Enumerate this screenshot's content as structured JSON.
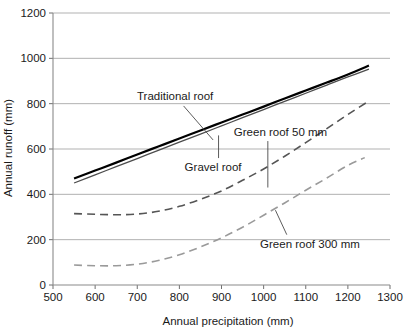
{
  "chart_data": {
    "type": "line",
    "title": "",
    "xlabel": "Annual precipitation (mm)",
    "ylabel": "Annual runoff (mm)",
    "xlim": [
      500,
      1300
    ],
    "ylim": [
      0,
      1200
    ],
    "xticks": [
      500,
      600,
      700,
      800,
      900,
      1000,
      1100,
      1200,
      1300
    ],
    "yticks": [
      0,
      200,
      400,
      600,
      800,
      1000,
      1200
    ],
    "xtick_labels": [
      "500",
      "600",
      "700",
      "800",
      "900",
      "1000",
      "1100",
      "1200",
      "1300"
    ],
    "ytick_labels": [
      "0",
      "200",
      "400",
      "600",
      "800",
      "1000",
      "1200"
    ],
    "grid": "horizontal",
    "legend_position": "inline-annotations",
    "series": [
      {
        "name": "Traditional roof",
        "style": "solid",
        "color": "#000000",
        "width": 2.2,
        "x": [
          550,
          600,
          650,
          700,
          750,
          800,
          850,
          900,
          950,
          1000,
          1050,
          1100,
          1150,
          1200,
          1250
        ],
        "values": [
          470,
          505,
          540,
          576,
          611,
          646,
          682,
          717,
          752,
          787,
          823,
          858,
          893,
          929,
          968
        ]
      },
      {
        "name": "Gravel roof",
        "style": "solid",
        "color": "#4d4d4d",
        "width": 1.3,
        "x": [
          550,
          600,
          650,
          700,
          750,
          800,
          850,
          900,
          950,
          1000,
          1050,
          1100,
          1150,
          1200,
          1250
        ],
        "values": [
          450,
          486,
          522,
          558,
          594,
          630,
          666,
          702,
          738,
          774,
          810,
          846,
          882,
          918,
          952
        ]
      },
      {
        "name": "Green roof 50 mm",
        "style": "dashed",
        "color": "#555555",
        "width": 1.6,
        "x": [
          550,
          600,
          650,
          700,
          750,
          800,
          850,
          900,
          950,
          1000,
          1050,
          1100,
          1150,
          1200,
          1250
        ],
        "values": [
          315,
          312,
          310,
          313,
          325,
          347,
          378,
          415,
          462,
          512,
          568,
          628,
          690,
          752,
          812
        ]
      },
      {
        "name": "Green roof 300 mm",
        "style": "dashed",
        "color": "#9a9a9a",
        "width": 1.6,
        "x": [
          550,
          600,
          650,
          700,
          750,
          800,
          850,
          900,
          950,
          1000,
          1050,
          1100,
          1150,
          1200,
          1240
        ],
        "values": [
          88,
          85,
          85,
          92,
          108,
          133,
          168,
          208,
          255,
          308,
          362,
          418,
          472,
          528,
          562
        ]
      }
    ],
    "annotations": [
      {
        "name": "traditional-roof",
        "text": "Traditional roof",
        "text_x": 790,
        "text_y": 835,
        "anchor": "middle",
        "leader_from": [
          810,
          790
        ],
        "leader_to": [
          880,
          640
        ]
      },
      {
        "name": "gravel-roof",
        "text": "Gravel roof",
        "text_x": 880,
        "text_y": 520,
        "anchor": "middle",
        "leader_from": [
          893,
          560
        ],
        "leader_to": [
          893,
          660
        ]
      },
      {
        "name": "green-roof-50",
        "text": "Green roof 50 mm",
        "text_x": 1040,
        "text_y": 675,
        "anchor": "middle",
        "leader_from": [
          1010,
          635
        ],
        "leader_to": [
          1010,
          430
        ]
      },
      {
        "name": "green-roof-300",
        "text": "Green roof 300 mm",
        "text_x": 1110,
        "text_y": 182,
        "anchor": "middle",
        "leader_from": [
          1055,
          222
        ],
        "leader_to": [
          1028,
          330
        ]
      }
    ]
  }
}
